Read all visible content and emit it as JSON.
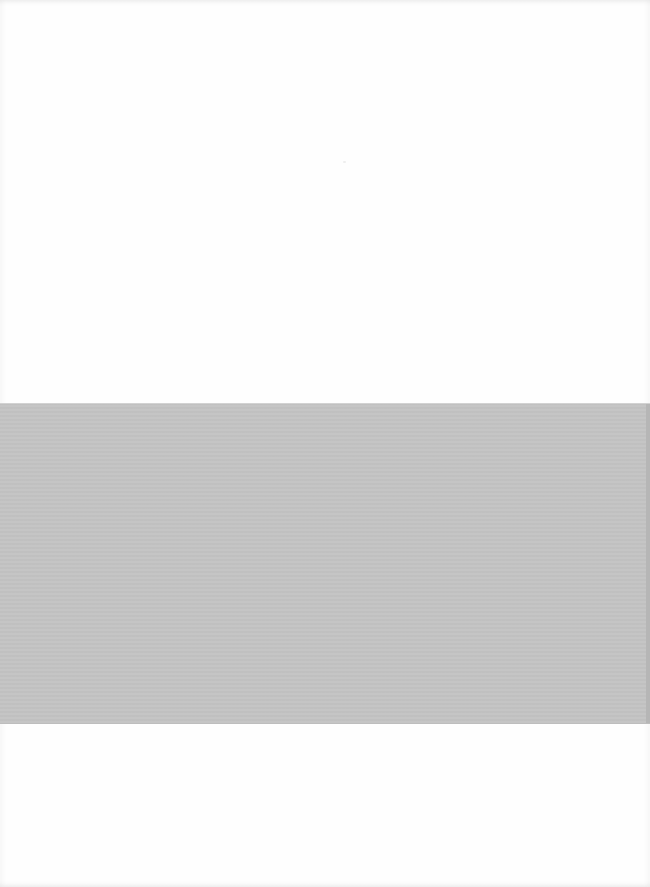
{
  "document": {
    "type": "scanned-page",
    "page_background": "#fefefe",
    "legible_text": [],
    "regions": [
      {
        "name": "upper-blank-area",
        "top": 0,
        "height": 403,
        "color": "#fefefe"
      },
      {
        "name": "gray-band",
        "top": 403,
        "height": 321,
        "color": "#c4c4c4"
      },
      {
        "name": "lower-blank-area",
        "top": 724,
        "height": 163,
        "color": "#fefefe"
      }
    ]
  }
}
